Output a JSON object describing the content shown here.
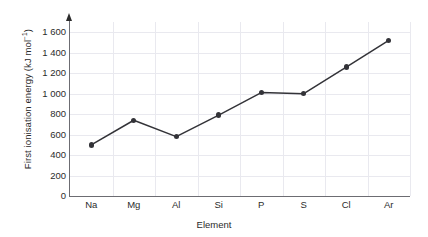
{
  "chart_data": {
    "type": "line",
    "title": "",
    "xlabel": "Element",
    "ylabel": "First ionisation energy (kJ mol",
    "ylabel_sup": "−1",
    "ylabel_suffix": ")",
    "categories": [
      "Na",
      "Mg",
      "Al",
      "Si",
      "P",
      "S",
      "Cl",
      "Ar"
    ],
    "values": [
      500,
      740,
      580,
      790,
      1010,
      1000,
      1260,
      1520
    ],
    "ylim": [
      0,
      1700
    ],
    "yticks": [
      0,
      200,
      400,
      600,
      800,
      1000,
      1200,
      1400,
      1600
    ],
    "ytick_labels": [
      "0",
      "200",
      "400",
      "600",
      "800",
      "1 000",
      "1 200",
      "1 400",
      "1 600"
    ],
    "grid": true,
    "legend": "none",
    "line_color": "#333338",
    "marker_color": "#333338",
    "axis_color": "#6c6c72",
    "grid_color": "#e9e9ef"
  }
}
